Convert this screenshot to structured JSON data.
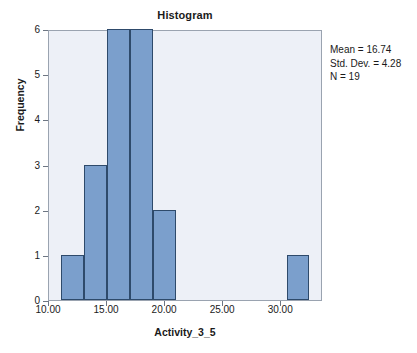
{
  "chart_data": {
    "type": "bar",
    "title": "Histogram",
    "xlabel": "Activity_3_5",
    "ylabel": "Frequency",
    "xlim": [
      10.0,
      33.6
    ],
    "ylim": [
      0,
      6
    ],
    "xticks": [
      "10.00",
      "15.00",
      "20.00",
      "25.00",
      "30.00"
    ],
    "xtick_values": [
      10,
      15,
      20,
      25,
      30
    ],
    "yticks": [
      "0",
      "1",
      "2",
      "3",
      "4",
      "5",
      "6"
    ],
    "ytick_values": [
      0,
      1,
      2,
      3,
      4,
      5,
      6
    ],
    "grid": false,
    "legend": "none",
    "bin_width": 2.45,
    "categories": [
      "11.0-13.0",
      "13.0-15.0",
      "15.0-17.0",
      "17.0-19.0",
      "19.0-21.0",
      "30.5-32.4"
    ],
    "bins": [
      {
        "x0": 11.0,
        "x1": 13.0,
        "count": 1
      },
      {
        "x0": 13.0,
        "x1": 15.0,
        "count": 3
      },
      {
        "x0": 15.0,
        "x1": 17.0,
        "count": 6
      },
      {
        "x0": 17.0,
        "x1": 19.0,
        "count": 6
      },
      {
        "x0": 19.0,
        "x1": 20.9,
        "count": 2
      },
      {
        "x0": 30.5,
        "x1": 32.4,
        "count": 1
      }
    ],
    "values": [
      1,
      3,
      6,
      6,
      2,
      1
    ],
    "colors": {
      "bar_fill": "#7b9fcc",
      "bar_edge": "#2e4a6b",
      "plot_background": "#edf0f7",
      "plot_border": "#9aa3b0",
      "text": "#1a1a1a",
      "tick": "#6d7683",
      "figure_background": "#ffffff"
    }
  },
  "statistics": {
    "mean_label": "Mean = 16.74",
    "std_dev_label": "Std. Dev. = 4.28",
    "n_label": "N = 19",
    "mean": 16.74,
    "std_dev": 4.28,
    "n": 19
  }
}
